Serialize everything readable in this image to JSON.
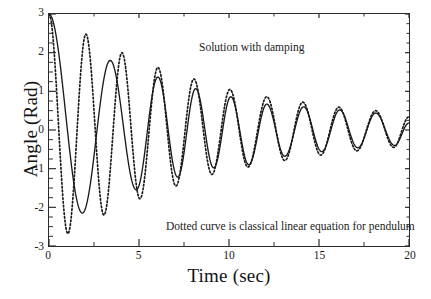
{
  "axes": {
    "xlabel": "Time (sec)",
    "ylabel": "Angle (Rad)",
    "xticks": [
      "0",
      "5",
      "10",
      "15",
      "20"
    ],
    "yticks": [
      "3",
      "2",
      "1",
      "0",
      "-1",
      "-2",
      "-3"
    ]
  },
  "annotations": {
    "top": "Solution with damping",
    "bottom": "Dotted curve is classical linear equation for pendulum"
  },
  "colors": {
    "axis": "#2b2b2b",
    "solid_curve": "#1a1a1a",
    "dotted_curve": "#1a1a1a",
    "background": "#ffffff"
  },
  "chart_data": {
    "type": "line",
    "title": "",
    "xlabel": "Time (sec)",
    "ylabel": "Angle (Rad)",
    "xlim": [
      0,
      20
    ],
    "ylim": [
      -3,
      3
    ],
    "xticks": [
      0,
      5,
      10,
      15,
      20
    ],
    "yticks": [
      -3,
      -2,
      -1,
      0,
      1,
      2,
      3
    ],
    "xminor_step": 2.5,
    "yminor_step": 0.25,
    "grid": false,
    "legend": "annotations-in-plot",
    "annotations": [
      {
        "text": "Solution with damping",
        "x": 8.6,
        "y": 2.55
      },
      {
        "text": "Dotted curve is classical linear equation for pendulum",
        "x": 11.0,
        "y": -2.0
      }
    ],
    "series": [
      {
        "name": "Solution with damping",
        "style": "solid",
        "description": "Damped nonlinear pendulum, theta0 = 3 rad, longer period at large amplitude",
        "model": "damped nonlinear pendulum",
        "initial_angle": 3,
        "damping_decay_per_sec": 0.115,
        "extrema": [
          {
            "t": 0.0,
            "y": 3.0
          },
          {
            "t": 1.85,
            "y": -2.15
          },
          {
            "t": 3.4,
            "y": 1.8
          },
          {
            "t": 4.85,
            "y": -1.55
          },
          {
            "t": 6.05,
            "y": 1.37
          },
          {
            "t": 7.15,
            "y": -1.22
          },
          {
            "t": 8.15,
            "y": 1.07
          },
          {
            "t": 9.15,
            "y": -0.98
          },
          {
            "t": 10.1,
            "y": 0.86
          },
          {
            "t": 11.1,
            "y": -0.9
          },
          {
            "t": 12.1,
            "y": 0.67
          },
          {
            "t": 13.1,
            "y": -0.68
          },
          {
            "t": 14.15,
            "y": 0.6
          },
          {
            "t": 15.15,
            "y": -0.56
          },
          {
            "t": 16.15,
            "y": 0.52
          },
          {
            "t": 17.15,
            "y": -0.46
          },
          {
            "t": 18.15,
            "y": 0.44
          },
          {
            "t": 19.2,
            "y": -0.4
          },
          {
            "t": 20.0,
            "y": 0.18
          }
        ]
      },
      {
        "name": "Classical linear equation for pendulum",
        "style": "dotted",
        "description": "Damped linear (small-angle) pendulum, theta0 = 3 rad, constant period ~2.0 s",
        "model": "damped linear pendulum",
        "initial_angle": 3,
        "period_sec": 2.0,
        "damping_decay_per_sec": 0.105,
        "extrema": [
          {
            "t": 0.0,
            "y": 3.0
          },
          {
            "t": 1.05,
            "y": -2.68
          },
          {
            "t": 2.05,
            "y": 2.48
          },
          {
            "t": 3.05,
            "y": -2.2
          },
          {
            "t": 4.05,
            "y": 2.0
          },
          {
            "t": 5.05,
            "y": -1.78
          },
          {
            "t": 6.05,
            "y": 1.62
          },
          {
            "t": 7.05,
            "y": -1.45
          },
          {
            "t": 8.05,
            "y": 1.32
          },
          {
            "t": 9.05,
            "y": -1.15
          },
          {
            "t": 10.05,
            "y": 1.05
          },
          {
            "t": 11.05,
            "y": -0.96
          },
          {
            "t": 12.1,
            "y": 0.86
          },
          {
            "t": 13.1,
            "y": -0.79
          },
          {
            "t": 14.1,
            "y": 0.72
          },
          {
            "t": 15.1,
            "y": -0.65
          },
          {
            "t": 16.1,
            "y": 0.59
          },
          {
            "t": 17.1,
            "y": -0.54
          },
          {
            "t": 18.15,
            "y": 0.5
          },
          {
            "t": 19.15,
            "y": -0.45
          },
          {
            "t": 20.0,
            "y": 0.34
          }
        ]
      }
    ]
  }
}
